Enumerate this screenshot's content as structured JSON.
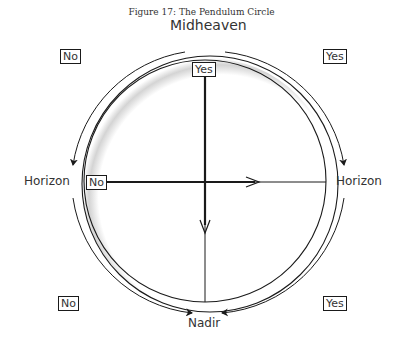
{
  "figure": {
    "title": "Figure 17: The Pendulum Circle"
  },
  "labels": {
    "top": "Midheaven",
    "bottom": "Nadir",
    "left": "Horizon",
    "right": "Horizon"
  },
  "answer_boxes": {
    "top_left": "No",
    "top_right": "Yes",
    "bottom_left": "No",
    "bottom_right": "Yes",
    "center_top": "Yes",
    "center_left": "No"
  },
  "colors": {
    "line": "#1a1a1a",
    "shadow": "#bdbdbd",
    "background": "#ffffff"
  }
}
